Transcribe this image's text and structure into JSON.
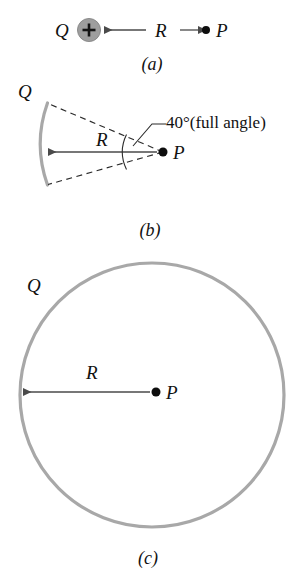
{
  "figure": {
    "background_color": "#ffffff",
    "gray_color": "#a8a8a8",
    "line_color": "#4a4a4a",
    "dot_color": "#0d0d0d"
  },
  "panel_a": {
    "caption": "(a)",
    "charge_label": "Q",
    "charge_symbol": "+",
    "distance_label": "R",
    "point_label": "P"
  },
  "panel_b": {
    "caption": "(b)",
    "charge_label": "Q",
    "distance_label": "R",
    "point_label": "P",
    "angle_label": "40°(full angle)",
    "angle_degrees": 40
  },
  "panel_c": {
    "caption": "(c)",
    "charge_label": "Q",
    "distance_label": "R",
    "point_label": "P"
  }
}
